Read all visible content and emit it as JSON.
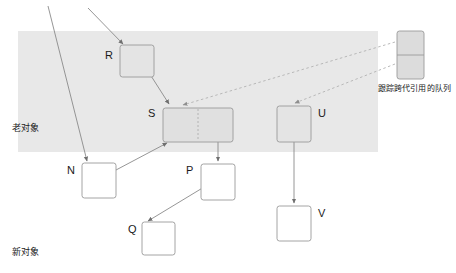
{
  "diagram": {
    "background_color": "#ffffff",
    "old_region": {
      "label": "老对象",
      "fill_color": "#e8e8e8",
      "x": 18,
      "y": 31,
      "width": 360,
      "height": 121,
      "label_x": 12,
      "label_y": 127
    },
    "new_region": {
      "label": "新对象",
      "fill_color": "#ffffff",
      "label_x": 12,
      "label_y": 251
    },
    "queue": {
      "caption": "跟踪跨代引用的队列",
      "fill_color": "#dcdcdc",
      "stroke_color": "#9a9a9a",
      "x": 397,
      "y": 31,
      "width": 27,
      "height": 48,
      "cells": 2,
      "caption_x": 378,
      "caption_y": 84
    },
    "nodes": [
      {
        "id": "R",
        "label": "R",
        "x": 120,
        "y": 45,
        "width": 34,
        "height": 32,
        "fill": "#e4e4e4",
        "stroke": "#9a9a9a",
        "label_side": "left",
        "label_x": 107,
        "label_y": 52
      },
      {
        "id": "S",
        "label": "S",
        "x": 163,
        "y": 108,
        "width": 70,
        "height": 34,
        "fill": "#e0e0e0",
        "stroke": "#9a9a9a",
        "label_side": "left",
        "label_x": 150,
        "label_y": 110,
        "divider": "dashed-vertical",
        "divider_offset": 0.5
      },
      {
        "id": "U",
        "label": "U",
        "x": 277,
        "y": 106,
        "width": 34,
        "height": 36,
        "fill": "#e4e4e4",
        "stroke": "#9a9a9a",
        "label_side": "right",
        "label_x": 318,
        "label_y": 110
      },
      {
        "id": "N",
        "label": "N",
        "x": 82,
        "y": 163,
        "width": 34,
        "height": 35,
        "fill": "#ffffff",
        "stroke": "#9a9a9a",
        "label_side": "left",
        "label_x": 69,
        "label_y": 166
      },
      {
        "id": "P",
        "label": "P",
        "x": 201,
        "y": 164,
        "width": 34,
        "height": 36,
        "fill": "#ffffff",
        "stroke": "#9a9a9a",
        "label_side": "left",
        "label_x": 188,
        "label_y": 166
      },
      {
        "id": "Q",
        "label": "Q",
        "x": 142,
        "y": 222,
        "width": 33,
        "height": 33,
        "fill": "#ffffff",
        "stroke": "#9a9a9a",
        "label_side": "left",
        "label_x": 130,
        "label_y": 225
      },
      {
        "id": "V",
        "label": "V",
        "x": 277,
        "y": 206,
        "width": 34,
        "height": 35,
        "fill": "#ffffff",
        "stroke": "#9a9a9a",
        "label_side": "right",
        "label_x": 318,
        "label_y": 208
      }
    ],
    "edges": [
      {
        "name": "incoming-to-R",
        "from": [
          88,
          8
        ],
        "to": [
          123,
          44
        ],
        "style": "solid",
        "arrow": true
      },
      {
        "name": "external-through-to-N",
        "from": [
          48,
          6
        ],
        "to": [
          87,
          162
        ],
        "style": "solid",
        "arrow": true
      },
      {
        "name": "R-to-S",
        "from": [
          146,
          68
        ],
        "to": [
          169,
          105
        ],
        "style": "solid",
        "arrow": true
      },
      {
        "name": "S-to-N",
        "from": [
          99,
          178
        ],
        "to": [
          166,
          142
        ],
        "style": "solid",
        "arrow": true
      },
      {
        "name": "S-to-P",
        "from": [
          218,
          125
        ],
        "to": [
          218,
          162
        ],
        "style": "solid",
        "arrow": true
      },
      {
        "name": "P-to-Q",
        "from": [
          213,
          180
        ],
        "to": [
          147,
          221
        ],
        "style": "solid",
        "arrow": true
      },
      {
        "name": "U-to-V",
        "from": [
          294,
          125
        ],
        "to": [
          294,
          204
        ],
        "style": "solid",
        "arrow": true
      },
      {
        "name": "queue-to-S",
        "from": [
          396,
          42
        ],
        "to": [
          182,
          105
        ],
        "style": "dotted",
        "arrow": true
      },
      {
        "name": "queue-to-U",
        "from": [
          396,
          64
        ],
        "to": [
          294,
          104
        ],
        "style": "dotted",
        "arrow": true
      }
    ],
    "colors": {
      "line": "#8a8a8a",
      "dotted_line": "#b0b0b0",
      "text": "#1a1a1a",
      "old_band": "#e8e8e8"
    }
  }
}
